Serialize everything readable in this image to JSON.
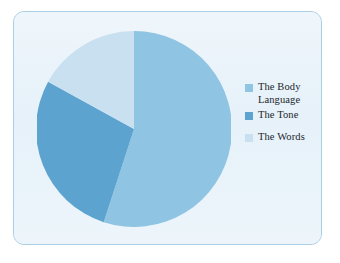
{
  "card": {
    "background": "#E9F3FA",
    "border_color": "#A9CFE6"
  },
  "legend": {
    "position": "right",
    "items": [
      {
        "label": "The Body\nLanguage",
        "color": "#8FC4E3"
      },
      {
        "label": "The Tone",
        "color": "#5CA3CF"
      },
      {
        "label": "The Words",
        "color": "#C9E0F1"
      }
    ]
  },
  "chart_data": {
    "type": "pie",
    "title": "",
    "categories": [
      "The Body Language",
      "The Tone",
      "The Words"
    ],
    "values": [
      55,
      28,
      17
    ],
    "unit": "%",
    "colors": [
      "#8FC4E3",
      "#5CA3CF",
      "#C9E0F1"
    ],
    "start_angle": 0,
    "direction": "clockwise",
    "legend_position": "right",
    "grid": false,
    "labels_shown": false,
    "slices": [
      {
        "name": "The Body Language",
        "value": 55,
        "color": "#8FC4E3",
        "start_deg": 0,
        "end_deg": 198
      },
      {
        "name": "The Tone",
        "value": 28,
        "color": "#5CA3CF",
        "start_deg": 198,
        "end_deg": 298.8
      },
      {
        "name": "The Words",
        "value": 17,
        "color": "#C9E0F1",
        "start_deg": 298.8,
        "end_deg": 360
      }
    ]
  }
}
